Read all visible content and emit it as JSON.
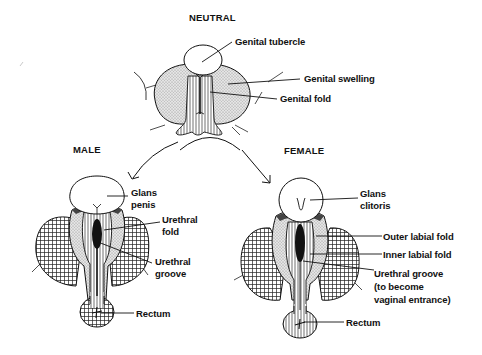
{
  "diagram": {
    "type": "anatomical-development",
    "colors": {
      "ink": "#111111",
      "stipple_fill": "#d9d9d9",
      "background": "#ffffff"
    },
    "stages": {
      "neutral": {
        "heading": "NEUTRAL",
        "labels": {
          "genital_tubercle": "Genital tubercle",
          "genital_swelling": "Genital swelling",
          "genital_fold": "Genital fold"
        }
      },
      "male": {
        "heading": "MALE",
        "labels": {
          "glans_line1": "Glans",
          "glans_line2": "penis",
          "urethral_fold_line1": "Urethral",
          "urethral_fold_line2": "fold",
          "urethral_groove_line1": "Urethral",
          "urethral_groove_line2": "groove",
          "rectum": "Rectum"
        }
      },
      "female": {
        "heading": "FEMALE",
        "labels": {
          "glans_line1": "Glans",
          "glans_line2": "clitoris",
          "outer_labial_fold": "Outer labial fold",
          "inner_labial_fold": "Inner labial fold",
          "urethral_groove_line1": "Urethral groove",
          "urethral_groove_line2": "(to become",
          "urethral_groove_line3": "vaginal entrance)",
          "rectum": "Rectum"
        }
      }
    }
  }
}
